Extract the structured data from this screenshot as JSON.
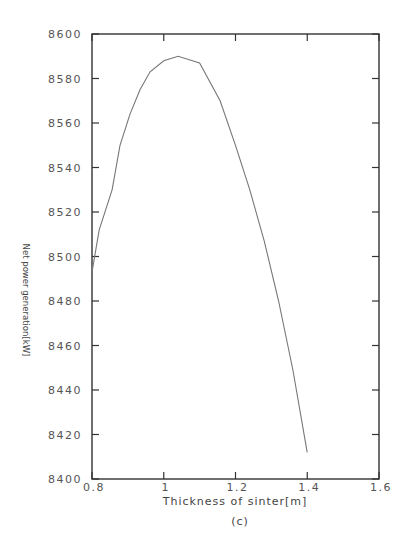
{
  "chart_data": {
    "type": "line",
    "title": "",
    "xlabel": "Thickness of sinter[m]",
    "ylabel": "Net power generation[kW]",
    "caption": "(c)",
    "xlim": [
      0.8,
      1.6
    ],
    "ylim": [
      8400,
      8600
    ],
    "xticks": [
      "0.8",
      "1",
      "1.2",
      "1.4",
      "1.6"
    ],
    "yticks": [
      "8400",
      "8420",
      "8440",
      "8460",
      "8480",
      "8500",
      "8520",
      "8540",
      "8560",
      "8580",
      "8600"
    ],
    "grid": false,
    "legend": null,
    "series": [
      {
        "name": "Net power generation",
        "color": "#777777",
        "x": [
          0.8,
          0.82,
          0.856,
          0.878,
          0.906,
          0.934,
          0.962,
          1.0,
          1.04,
          1.1,
          1.157,
          1.2,
          1.24,
          1.28,
          1.32,
          1.36,
          1.4
        ],
        "y": [
          8493,
          8512,
          8530,
          8550,
          8564,
          8575,
          8583,
          8588,
          8590,
          8587,
          8570,
          8550,
          8530,
          8507,
          8480,
          8449,
          8412
        ]
      }
    ]
  }
}
